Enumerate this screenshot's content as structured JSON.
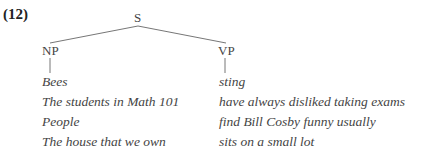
{
  "example_number": "(12)",
  "tree": {
    "root": "S",
    "children": [
      {
        "label": "NP",
        "terminal": "Bees"
      },
      {
        "label": "VP",
        "terminal": "sting"
      }
    ]
  },
  "rows": [
    {
      "np": "Bees",
      "vp": "sting"
    },
    {
      "np": "The students in Math 101",
      "vp": "have always disliked taking exams"
    },
    {
      "np": "People",
      "vp": "find Bill Cosby funny usually"
    },
    {
      "np": "The house that we own",
      "vp": "sits on a small lot"
    }
  ]
}
